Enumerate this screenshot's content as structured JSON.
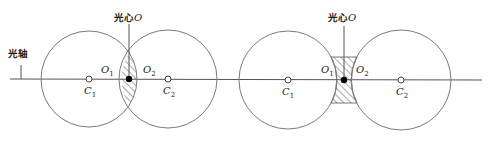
{
  "figure": {
    "axis_label": "光轴",
    "colors": {
      "line": "#555555",
      "stroke": "#7a7a7a",
      "dot": "#000000",
      "background": "#ffffff"
    },
    "left_diagram": {
      "name": "convex-lens",
      "optical_center_label": "光心",
      "optical_center_symbol": "O",
      "o1": "O",
      "o1_sub": "1",
      "o2": "O",
      "o2_sub": "2",
      "c1": "C",
      "c1_sub": "1",
      "c2": "C",
      "c2_sub": "2"
    },
    "right_diagram": {
      "name": "concave-lens",
      "optical_center_label": "光心",
      "optical_center_symbol": "O",
      "o1": "O",
      "o1_sub": "1",
      "o2": "O",
      "o2_sub": "2",
      "c1": "C",
      "c1_sub": "1",
      "c2": "C",
      "c2_sub": "2"
    }
  }
}
